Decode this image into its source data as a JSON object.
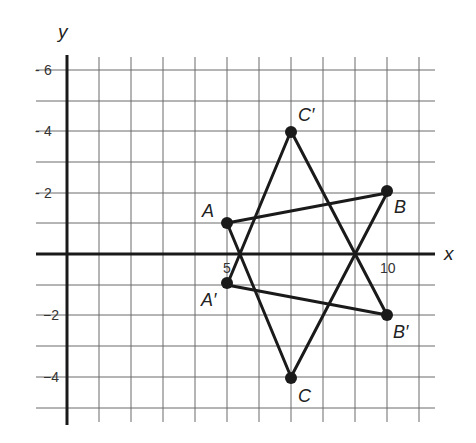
{
  "diagram": {
    "axes": {
      "x_label": "x",
      "y_label": "y"
    },
    "y_ticks": [
      {
        "value": 6,
        "label": "6"
      },
      {
        "value": 4,
        "label": "4"
      },
      {
        "value": 2,
        "label": "2"
      },
      {
        "value": -2,
        "label": "−2"
      },
      {
        "value": -4,
        "label": "−4"
      }
    ],
    "x_ticks": [
      {
        "value": 5,
        "label": "5"
      },
      {
        "value": 10,
        "label": "10"
      }
    ],
    "points": {
      "A": {
        "label": "A",
        "x": 5,
        "y": 1
      },
      "B": {
        "label": "B",
        "x": 10,
        "y": 2
      },
      "C": {
        "label": "C",
        "x": 7,
        "y": -4
      },
      "A_prime": {
        "label": "A′",
        "x": 5,
        "y": -1
      },
      "B_prime": {
        "label": "B′",
        "x": 10,
        "y": -2
      },
      "C_prime": {
        "label": "C′",
        "x": 7,
        "y": 4
      }
    },
    "triangles": [
      {
        "name": "ABC",
        "vertices": [
          "A",
          "B",
          "C"
        ]
      },
      {
        "name": "A′B′C′",
        "vertices": [
          "A′",
          "B′",
          "C′"
        ]
      }
    ],
    "colors": {
      "grid": "#6a6a6a",
      "axis": "#1a1a1a",
      "shape": "#1a1a1a"
    }
  }
}
